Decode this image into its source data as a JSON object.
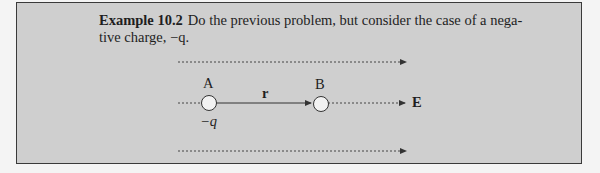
{
  "example": {
    "heading": "Example 10.2",
    "line1": "Do the previous problem, but consider the case of a nega-",
    "line2": "tive charge, −q."
  },
  "diagram": {
    "point_a_label": "A",
    "point_b_label": "B",
    "charge_label": "−q",
    "vector_label": "r",
    "field_label": "E",
    "colors": {
      "box_fill": "#cfcfcf",
      "border": "#3a3a3a",
      "circle_fill": "#f2f2f2"
    }
  }
}
